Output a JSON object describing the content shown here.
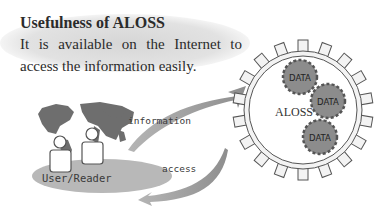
{
  "header": {
    "title": "Usefulness of ALOSS",
    "description": "It is available on the Internet to access the information easily."
  },
  "user_side": {
    "label": "User/Reader",
    "icon": "world-map-with-users"
  },
  "flows": {
    "top_arrow_label": "information",
    "bottom_arrow_label": "access"
  },
  "system": {
    "label": "ALOSS",
    "gears": [
      {
        "label": "DATA"
      },
      {
        "label": "DATA"
      },
      {
        "label": "DATA"
      }
    ]
  },
  "colors": {
    "text": "#2b2b2b",
    "bubble": "#d9d9d9",
    "map": "#6e6e6e",
    "arrow": "#9a9a9a",
    "gear_outer": "#f2f2f2",
    "gear_data": "#8c8c8c",
    "ellipse": "#b5b5b5"
  }
}
